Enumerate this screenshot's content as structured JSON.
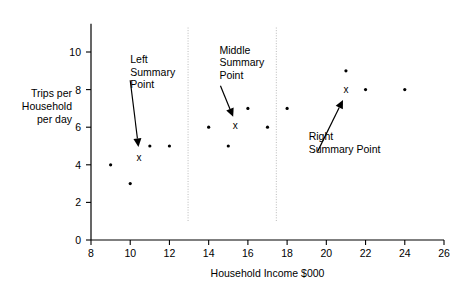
{
  "chart_data": {
    "type": "scatter",
    "title": "",
    "xlabel": "Household Income $000",
    "ylabel": "Trips per Household per day",
    "ylabel_lines": [
      "Trips per",
      "Household",
      "per day"
    ],
    "xlim": [
      8,
      26
    ],
    "ylim": [
      0,
      11.5
    ],
    "xticks": [
      8,
      10,
      12,
      14,
      16,
      18,
      20,
      22,
      24,
      26
    ],
    "xticklabels": [
      "8",
      "10",
      "12",
      "14",
      "16",
      "18",
      "20",
      "22",
      "24",
      "26"
    ],
    "yticks": [
      0,
      2,
      4,
      6,
      8,
      10
    ],
    "yticklabels": [
      "0",
      "2",
      "4",
      "6",
      "8",
      "10"
    ],
    "grid": false,
    "legend": "none",
    "series": [
      {
        "name": "observations",
        "marker": "dot",
        "points": [
          {
            "x": 9,
            "y": 4
          },
          {
            "x": 10,
            "y": 3
          },
          {
            "x": 11,
            "y": 5
          },
          {
            "x": 12,
            "y": 5
          },
          {
            "x": 14,
            "y": 6
          },
          {
            "x": 15,
            "y": 5
          },
          {
            "x": 16,
            "y": 7
          },
          {
            "x": 17,
            "y": 6
          },
          {
            "x": 18,
            "y": 7
          },
          {
            "x": 21,
            "y": 9
          },
          {
            "x": 22,
            "y": 8
          },
          {
            "x": 24,
            "y": 8
          }
        ]
      },
      {
        "name": "summary points",
        "marker": "x",
        "points": [
          {
            "x": 10.45,
            "y": 4.4,
            "label": "x"
          },
          {
            "x": 15.35,
            "y": 6.1,
            "label": "x"
          },
          {
            "x": 21.0,
            "y": 8.0,
            "label": "x"
          }
        ]
      }
    ],
    "dividers": [
      {
        "x": 12.95,
        "y_top": 11.3,
        "y_bottom": 1.0
      },
      {
        "x": 17.45,
        "y_top": 11.3,
        "y_bottom": 1.0
      }
    ],
    "annotations": [
      {
        "id": "left",
        "lines": [
          "Left",
          "Summary",
          "Point"
        ],
        "text_x": 10.0,
        "text_y": 9.4,
        "arrow_from": {
          "x": 10.0,
          "y": 8.5
        },
        "arrow_to": {
          "x": 10.42,
          "y": 4.95
        }
      },
      {
        "id": "middle",
        "lines": [
          "Middle",
          "Summary",
          "Point"
        ],
        "text_x": 14.55,
        "text_y": 9.9,
        "arrow_from": {
          "x": 14.6,
          "y": 8.2
        },
        "arrow_to": {
          "x": 15.25,
          "y": 6.55
        }
      },
      {
        "id": "right",
        "lines": [
          "Right",
          "Summary Point"
        ],
        "text_x": 19.1,
        "text_y": 5.3,
        "arrow_from": {
          "x": 19.55,
          "y": 4.7
        },
        "arrow_to": {
          "x": 20.85,
          "y": 7.45
        }
      }
    ]
  }
}
